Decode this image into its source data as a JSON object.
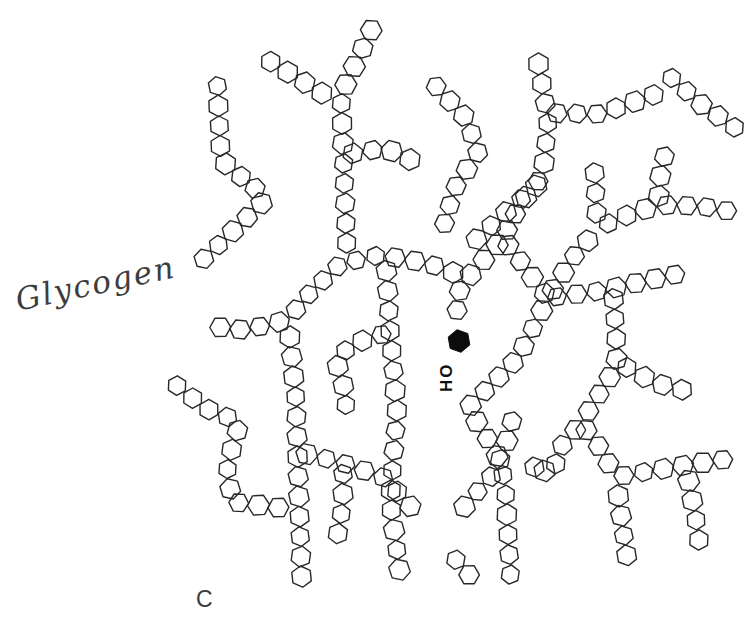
{
  "figure": {
    "label_handwritten": "Glycogen",
    "reducing_end_label": "HO",
    "panel_letter": "C",
    "colors": {
      "line": "#282828",
      "background": "#ffffff",
      "reducing_end_fill": "#0c0c0c",
      "handwriting_ink": "#3d3d3d"
    },
    "hexagon": {
      "radius": 10.3,
      "spacing": 20
    },
    "reducing_end": {
      "x": 459,
      "y": 341,
      "r": 11.5
    },
    "chains": [
      {
        "id": "top-vertical",
        "points": [
          [
            375,
            22
          ],
          [
            341,
            95
          ],
          [
            347,
            252
          ]
        ]
      },
      {
        "id": "top-diag-branch",
        "points": [
          [
            263,
            57
          ],
          [
            333,
            100
          ]
        ]
      },
      {
        "id": "left-vertical",
        "points": [
          [
            217,
            77
          ],
          [
            221,
            160
          ],
          [
            262,
            194
          ]
        ]
      },
      {
        "id": "left-downleft",
        "points": [
          [
            268,
            197
          ],
          [
            228,
            236
          ],
          [
            190,
            272
          ]
        ]
      },
      {
        "id": "sw-sweep",
        "points": [
          [
            503,
            238
          ],
          [
            468,
            278
          ],
          [
            427,
            263
          ],
          [
            380,
            255
          ],
          [
            340,
            264
          ],
          [
            305,
            298
          ],
          [
            288,
            320
          ]
        ]
      },
      {
        "id": "left-arm",
        "points": [
          [
            288,
            320
          ],
          [
            245,
            330
          ],
          [
            208,
            326
          ]
        ]
      },
      {
        "id": "wavy-top",
        "points": [
          [
            344,
            155
          ],
          [
            385,
            148
          ],
          [
            428,
            168
          ]
        ]
      },
      {
        "id": "upper-diag",
        "points": [
          [
            430,
            80
          ],
          [
            466,
            118
          ],
          [
            478,
            152
          ],
          [
            455,
            188
          ],
          [
            442,
            232
          ]
        ]
      },
      {
        "id": "center-vertical",
        "points": [
          [
            537,
            55
          ],
          [
            548,
            120
          ],
          [
            543,
            175
          ],
          [
            520,
            205
          ],
          [
            503,
            238
          ]
        ]
      },
      {
        "id": "center-right-arm",
        "points": [
          [
            548,
            113
          ],
          [
            600,
            114
          ],
          [
            662,
            92
          ]
        ]
      },
      {
        "id": "topright-diag",
        "points": [
          [
            665,
            72
          ],
          [
            702,
            105
          ],
          [
            750,
            138
          ]
        ]
      },
      {
        "id": "center-branch",
        "points": [
          [
            543,
            180
          ],
          [
            505,
            213
          ],
          [
            467,
            248
          ]
        ]
      },
      {
        "id": "reducing-chain",
        "points": [
          [
            462,
            282
          ],
          [
            456,
            305
          ],
          [
            460,
            324
          ]
        ]
      },
      {
        "id": "mid-trunk",
        "points": [
          [
            386,
            262
          ],
          [
            390,
            330
          ],
          [
            397,
            412
          ],
          [
            390,
            500
          ],
          [
            402,
            588
          ]
        ]
      },
      {
        "id": "mid-branch-left",
        "points": [
          [
            390,
            332
          ],
          [
            352,
            344
          ],
          [
            336,
            360
          ],
          [
            347,
            398
          ],
          [
            342,
            428
          ]
        ]
      },
      {
        "id": "se-snake",
        "points": [
          [
            503,
            238
          ],
          [
            548,
            298
          ],
          [
            518,
            358
          ],
          [
            468,
            408
          ],
          [
            496,
            452
          ],
          [
            505,
            482
          ],
          [
            511,
            587
          ]
        ]
      },
      {
        "id": "snake-branch",
        "points": [
          [
            497,
            470
          ],
          [
            470,
            500
          ],
          [
            448,
            527
          ]
        ]
      },
      {
        "id": "snake-stub",
        "points": [
          [
            497,
            468
          ],
          [
            511,
            430
          ],
          [
            514,
            400
          ]
        ]
      },
      {
        "id": "h-mid",
        "points": [
          [
            548,
            298
          ],
          [
            600,
            291
          ],
          [
            650,
            280
          ],
          [
            697,
            270
          ]
        ]
      },
      {
        "id": "q-diag",
        "points": [
          [
            548,
            297
          ],
          [
            575,
            255
          ],
          [
            600,
            227
          ]
        ]
      },
      {
        "id": "q-vert",
        "points": [
          [
            597,
            222
          ],
          [
            594,
            160
          ]
        ]
      },
      {
        "id": "q-right",
        "points": [
          [
            600,
            227
          ],
          [
            630,
            214
          ],
          [
            658,
            205
          ]
        ]
      },
      {
        "id": "q-upright",
        "points": [
          [
            658,
            205
          ],
          [
            661,
            168
          ],
          [
            671,
            135
          ]
        ]
      },
      {
        "id": "q-far-right",
        "points": [
          [
            658,
            205
          ],
          [
            700,
            206
          ],
          [
            745,
            214
          ]
        ]
      },
      {
        "id": "right-trunk",
        "points": [
          [
            613,
            290
          ],
          [
            617,
            350
          ],
          [
            616,
            367
          ],
          [
            598,
            396
          ],
          [
            581,
            423
          ]
        ]
      },
      {
        "id": "right-arm",
        "points": [
          [
            619,
            363
          ],
          [
            655,
            383
          ],
          [
            695,
            393
          ]
        ]
      },
      {
        "id": "r-downleft",
        "points": [
          [
            581,
            423
          ],
          [
            560,
            448
          ],
          [
            553,
            474
          ]
        ]
      },
      {
        "id": "r-stub",
        "points": [
          [
            553,
            474
          ],
          [
            526,
            464
          ]
        ]
      },
      {
        "id": "r-downright",
        "points": [
          [
            581,
            423
          ],
          [
            603,
            452
          ],
          [
            615,
            477
          ]
        ]
      },
      {
        "id": "r-bottom-arm",
        "points": [
          [
            615,
            477
          ],
          [
            680,
            466
          ],
          [
            742,
            457
          ]
        ]
      },
      {
        "id": "r-vert1",
        "points": [
          [
            617,
            487
          ],
          [
            628,
            565
          ]
        ]
      },
      {
        "id": "r-vert2",
        "points": [
          [
            687,
            472
          ],
          [
            696,
            520
          ],
          [
            702,
            562
          ]
        ]
      },
      {
        "id": "b-trunk",
        "points": [
          [
            289,
            328
          ],
          [
            296,
            400
          ],
          [
            298,
            470
          ],
          [
            302,
            590
          ]
        ]
      },
      {
        "id": "b-arm",
        "points": [
          [
            298,
            452
          ],
          [
            340,
            462
          ],
          [
            385,
            478
          ],
          [
            420,
            517
          ]
        ]
      },
      {
        "id": "b-squiggle",
        "points": [
          [
            343,
            465
          ],
          [
            343,
            503
          ],
          [
            336,
            545
          ]
        ]
      },
      {
        "id": "p-diag",
        "points": [
          [
            170,
            380
          ],
          [
            205,
            408
          ],
          [
            240,
            422
          ]
        ]
      },
      {
        "id": "p-curve",
        "points": [
          [
            240,
            422
          ],
          [
            227,
            465
          ],
          [
            232,
            502
          ],
          [
            291,
            509
          ]
        ]
      },
      {
        "id": "bottom-diag",
        "points": [
          [
            450,
            553
          ],
          [
            478,
            585
          ]
        ]
      }
    ]
  }
}
